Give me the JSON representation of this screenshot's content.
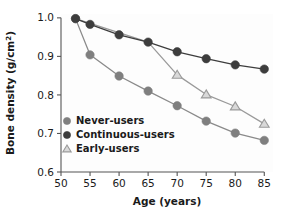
{
  "chart_data": {
    "type": "line",
    "title": "",
    "xlabel": "Age (years)",
    "ylabel": "Bone density (g∕cm²)",
    "ylabel_main": "Bone density (g∕cm",
    "ylabel_sup": "2",
    "ylabel_tail": ")",
    "xlim": [
      50,
      86.5
    ],
    "ylim": [
      0.6,
      1.01
    ],
    "grid": false,
    "legend_position": "lower-left-inside",
    "xticks": [
      50,
      55,
      60,
      65,
      70,
      75,
      80,
      85
    ],
    "xtick_labels": [
      "50",
      "55",
      "60",
      "65",
      "70",
      "75",
      "80",
      "85"
    ],
    "yticks": [
      0.6,
      0.7,
      0.8,
      0.9,
      1.0
    ],
    "ytick_labels": [
      "0.6",
      "0.7",
      "0.8",
      "0.9",
      "1.0"
    ],
    "series": [
      {
        "name": "Never-users",
        "marker": "filled-circle",
        "color": "#7f7f7f",
        "line_color": "#8a8a8a",
        "x": [
          52.5,
          55,
          60,
          65,
          70,
          75,
          80,
          85
        ],
        "values": [
          0.998,
          0.904,
          0.849,
          0.81,
          0.772,
          0.732,
          0.701,
          0.682
        ]
      },
      {
        "name": "Continuous-users",
        "marker": "filled-circle",
        "color": "#3d3d3d",
        "line_color": "#3d3d3d",
        "x": [
          52.5,
          55,
          60,
          65,
          70,
          75,
          80,
          85
        ],
        "values": [
          0.998,
          0.983,
          0.956,
          0.937,
          0.912,
          0.894,
          0.878,
          0.867
        ]
      },
      {
        "name": "Early-users",
        "marker": "open-triangle",
        "color": "#9a9a9a",
        "line_color": "#9a9a9a",
        "x": [
          52.5,
          65,
          70,
          75,
          80,
          85
        ],
        "values": [
          0.998,
          0.937,
          0.852,
          0.801,
          0.77,
          0.725
        ]
      }
    ]
  },
  "legend": {
    "items": [
      {
        "label": "Never-users",
        "marker": "filled-circle",
        "color": "#7f7f7f"
      },
      {
        "label": "Continuous-users",
        "marker": "filled-circle",
        "color": "#3d3d3d"
      },
      {
        "label": "Early-users",
        "marker": "open-triangle",
        "color": "#9a9a9a"
      }
    ]
  },
  "style": {
    "background": "#ffffff",
    "plot_background": "#fdfdfd",
    "axis_color": "#555555"
  }
}
